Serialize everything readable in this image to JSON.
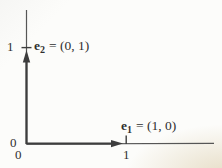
{
  "figure": {
    "vectors": {
      "e1": {
        "symbol": "e",
        "subscript": "1",
        "value": "= (1, 0)"
      },
      "e2": {
        "symbol": "e",
        "subscript": "2",
        "value": "= (0, 1)"
      }
    },
    "axis_labels": {
      "origin_y": "0",
      "origin_x": "0",
      "x_one": "1",
      "y_one": "1"
    },
    "colors": {
      "ink": "#3d3d3d",
      "axis": "#565656",
      "background": "#fcfcfa",
      "page_tint": "#d5c49c"
    }
  }
}
